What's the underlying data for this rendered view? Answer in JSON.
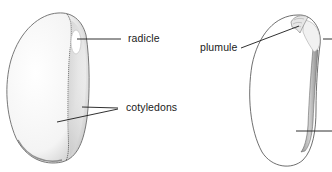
{
  "figure": {
    "type": "botanical-diagram",
    "panels": [
      {
        "id": "left-seed",
        "view": "whole seed, seed coat removed",
        "labels": [
          {
            "text": "radicle",
            "pointer_count": 1
          },
          {
            "text": "cotyledons",
            "pointer_count": 2
          }
        ]
      },
      {
        "id": "right-seed",
        "view": "one cotyledon with embryo",
        "labels": [
          {
            "text": "plumule",
            "pointer_count": 1
          }
        ],
        "unlabeled_pointers_cropped_right": 2
      }
    ]
  },
  "labels": {
    "radicle": "radicle",
    "cotyledons": "cotyledons",
    "plumule": "plumule"
  },
  "colors": {
    "background": "#ffffff",
    "ink": "#1a1a1a",
    "stipple": "#555555"
  }
}
